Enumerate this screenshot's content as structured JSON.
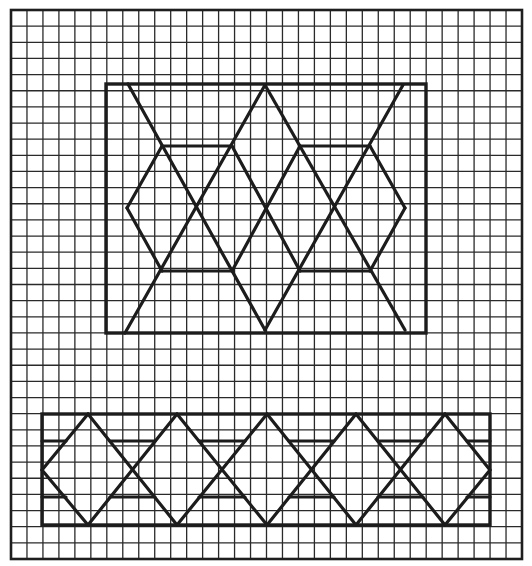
{
  "canvas": {
    "width": 532,
    "height": 566,
    "background": "#ffffff"
  },
  "grid": {
    "x0": 11,
    "y0": 10,
    "x1": 522,
    "y1": 559,
    "cols": 32,
    "rows": 34,
    "line_color": "#2a2a2a"
  },
  "pattern_color": "#1c1c1c",
  "upper_panel": {
    "frame": {
      "x": 106,
      "y": 84,
      "w": 320,
      "h": 249
    },
    "segments": [
      [
        128,
        84,
        265,
        330
      ],
      [
        265,
        85,
        125,
        333
      ],
      [
        265,
        85,
        405,
        330
      ],
      [
        403,
        85,
        265,
        330
      ],
      [
        162,
        146,
        127,
        208
      ],
      [
        127,
        208,
        162,
        271
      ],
      [
        370,
        146,
        405,
        208
      ],
      [
        405,
        208,
        370,
        271
      ],
      [
        232,
        146,
        300,
        271
      ],
      [
        300,
        146,
        232,
        271
      ],
      [
        162,
        146,
        232,
        146
      ],
      [
        300,
        146,
        370,
        146
      ],
      [
        162,
        271,
        233,
        271
      ],
      [
        300,
        271,
        370,
        271
      ]
    ]
  },
  "lower_strip": {
    "frame": {
      "x": 42,
      "y": 414,
      "w": 448,
      "h": 111
    },
    "top_y": 414,
    "mid_y": 470,
    "bottom_y": 525,
    "upper_bar_y": 441,
    "lower_bar_y": 497,
    "peaks_x": [
      88,
      177,
      267,
      356,
      445
    ],
    "bar_offset": 22
  }
}
